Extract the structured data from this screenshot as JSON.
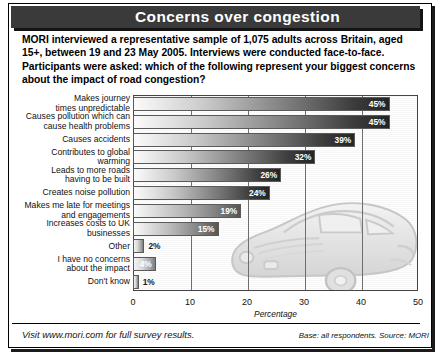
{
  "header": {
    "title": "Concerns over congestion"
  },
  "intro": {
    "text": "MORI interviewed a representative sample of 1,075 adults across Britain, aged 15+, between 19 and 23 May 2005. Interviews were conducted face-to-face. Participants  were asked: which of the following represent your biggest concerns about the impact of road congestion?"
  },
  "footer": {
    "left": "Visit www.mori.com for full survey results.",
    "right": "Base: all respondents. Source: MORI"
  },
  "chart_data": {
    "type": "bar",
    "orientation": "horizontal",
    "title": "Concerns over congestion",
    "xlabel": "Percentage",
    "ylabel": "",
    "xlim": [
      0,
      50
    ],
    "xticks": [
      0,
      10,
      20,
      30,
      40,
      50
    ],
    "xtick_labels": [
      "0",
      "10",
      "20",
      "30",
      "40",
      "50"
    ],
    "grid": true,
    "legend": "none",
    "value_suffix": "%",
    "categories": [
      "Makes journey\ntimes unpredictable",
      "Causes pollution which can\ncause health problems",
      "Causes accidents",
      "Contributes to global\nwarming",
      "Leads to more roads\nhaving to be built",
      "Creates noise pollution",
      "Makes me late for meetings\nand engagements",
      "Increases costs to UK\nbusinesses",
      "Other",
      "I have no concerns\nabout the impact",
      "Don't know"
    ],
    "values": [
      45,
      45,
      39,
      32,
      26,
      24,
      19,
      15,
      2,
      4,
      1
    ],
    "value_labels": [
      "45%",
      "45%",
      "39%",
      "32%",
      "26%",
      "24%",
      "19%",
      "15%",
      "2%",
      "4%",
      "1%"
    ],
    "annotation": "car-watermark-illustration"
  },
  "colors": {
    "banner_background": "#3a3a3a",
    "banner_text": "#ffffff",
    "bar_gradient_start": "#fbfbfb",
    "bar_gradient_end": "#242424",
    "plot_border": "#444444",
    "page_background": "#ffffff"
  }
}
